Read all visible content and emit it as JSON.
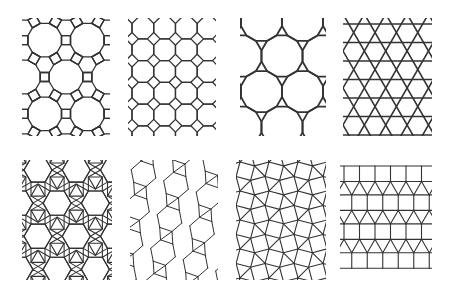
{
  "figure": {
    "background": "#ffffff",
    "stroke_color": "#333333",
    "tiles": [
      {
        "id": "tile-4-6-12",
        "name": "truncated trihexagonal (4.6.12)",
        "x": 22,
        "y": 18,
        "w": 88,
        "h": 118,
        "stroke_width": 1.3
      },
      {
        "id": "tile-4-8-8",
        "name": "truncated square (4.8.8)",
        "x": 128,
        "y": 18,
        "w": 88,
        "h": 118,
        "stroke_width": 1.3
      },
      {
        "id": "tile-3-12-12",
        "name": "truncated hexagonal (3.12.12)",
        "x": 240,
        "y": 18,
        "w": 86,
        "h": 118,
        "stroke_width": 1.8
      },
      {
        "id": "tile-3-6-3-6",
        "name": "trihexagonal / kagome (3.6.3.6)",
        "x": 343,
        "y": 18,
        "w": 89,
        "h": 118,
        "stroke_width": 1.6
      },
      {
        "id": "tile-3-4-6-4",
        "name": "rhombitrihexagonal (3.4.6.4)",
        "x": 22,
        "y": 160,
        "w": 90,
        "h": 120,
        "stroke_width": 1.1
      },
      {
        "id": "tile-3-3-3-3-6",
        "name": "snub hexagonal (3.3.3.3.6)",
        "x": 130,
        "y": 160,
        "w": 88,
        "h": 120,
        "stroke_width": 1.0
      },
      {
        "id": "tile-3-3-4-3-4",
        "name": "snub square (3.3.4.3.4)",
        "x": 236,
        "y": 160,
        "w": 90,
        "h": 120,
        "stroke_width": 1.1
      },
      {
        "id": "tile-3-3-3-4-4",
        "name": "elongated triangular (3.3.3.4.4)",
        "x": 340,
        "y": 160,
        "w": 92,
        "h": 120,
        "stroke_width": 1.1
      }
    ]
  }
}
